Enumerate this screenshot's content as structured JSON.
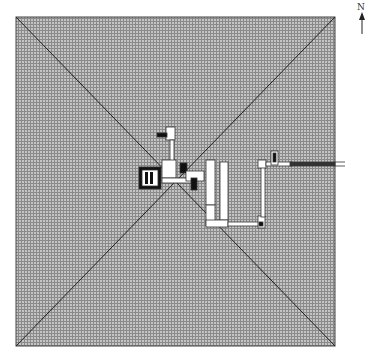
{
  "diagram": {
    "type": "architectural-plan",
    "compass": {
      "label": "N",
      "direction": "up"
    },
    "colors": {
      "fill_hatch": "#9a9a9a",
      "line": "#222222",
      "chamber": "#ffffff",
      "dark": "#111111"
    }
  }
}
